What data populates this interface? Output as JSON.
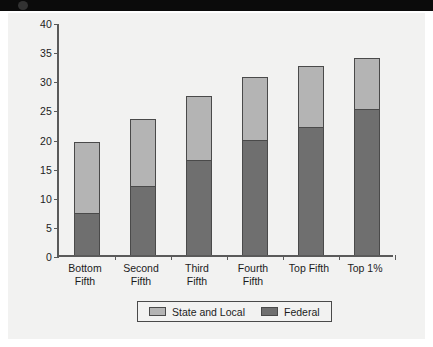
{
  "chart_data": {
    "type": "bar",
    "subtype": "stacked-bar",
    "title": "",
    "xlabel": "",
    "ylabel": "",
    "ylim": [
      0,
      40
    ],
    "ytick_step": 5,
    "yticks": [
      40,
      35,
      30,
      25,
      20,
      15,
      10,
      5,
      0
    ],
    "grid": false,
    "legend_position": "bottom",
    "categories": [
      "Bottom\nFifth",
      "Second\nFifth",
      "Third\nFifth",
      "Fourth\nFifth",
      "Top Fifth",
      "Top 1%"
    ],
    "series": [
      {
        "name": "Federal",
        "color": "#6f6f6f",
        "values": [
          7.2,
          11.9,
          16.3,
          19.8,
          22.0,
          25.1
        ]
      },
      {
        "name": "State and Local",
        "color": "#b4b4b4",
        "values": [
          12.2,
          11.4,
          11.0,
          10.8,
          10.4,
          8.8
        ]
      }
    ],
    "totals": [
      19.4,
      23.3,
      27.3,
      30.6,
      32.4,
      33.9
    ]
  },
  "legend": {
    "items": [
      {
        "label": "State and Local",
        "color": "#b4b4b4",
        "swatch_name": "state-and-local-swatch"
      },
      {
        "label": "Federal",
        "color": "#6f6f6f",
        "swatch_name": "federal-swatch"
      }
    ]
  },
  "axis": {
    "y_labels": [
      "40",
      "35",
      "30",
      "25",
      "20",
      "15",
      "10",
      "5",
      "0"
    ]
  }
}
